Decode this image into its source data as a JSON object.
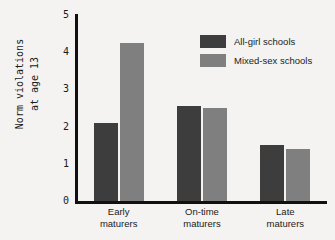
{
  "chart_data": {
    "type": "bar",
    "title": "",
    "xlabel": "",
    "ylabel": "Norm violations at age 13",
    "ylabel_lines": [
      "Norm violations",
      "at age 13"
    ],
    "categories": [
      "Early maturers",
      "On-time maturers",
      "Late maturers"
    ],
    "category_lines": [
      [
        "Early",
        "maturers"
      ],
      [
        "On-time",
        "maturers"
      ],
      [
        "Late",
        "maturers"
      ]
    ],
    "series": [
      {
        "name": "All-girl schools",
        "color": "#3d3d3d",
        "values": [
          2.1,
          2.55,
          1.5
        ]
      },
      {
        "name": "Mixed-sex schools",
        "color": "#7f7f7f",
        "values": [
          4.25,
          2.5,
          1.4
        ]
      }
    ],
    "ylim": [
      0,
      5
    ],
    "yticks": [
      0,
      1,
      2,
      3,
      4,
      5
    ],
    "ytick_labels": [
      "0",
      "1",
      "2",
      "3",
      "4",
      "5"
    ],
    "grid": false,
    "legend_position": "top-right",
    "background_color": "#f4f3f1",
    "axis_color": "#101010"
  },
  "legend": {
    "items": [
      {
        "label": "All-girl schools"
      },
      {
        "label": "Mixed-sex schools"
      }
    ]
  }
}
